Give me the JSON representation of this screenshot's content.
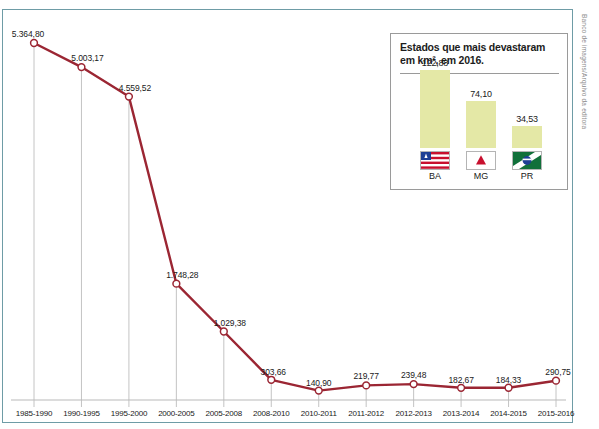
{
  "credit": "Banco de imagens/Arquivo da editora",
  "cropped_caption": "",
  "chart_data": {
    "type": "line",
    "title": "",
    "xlabel": "",
    "ylabel": "",
    "categories": [
      "1985-1990",
      "1990-1995",
      "1995-2000",
      "2000-2005",
      "2005-2008",
      "2008-2010",
      "2010-2011",
      "2011-2012",
      "2012-2013",
      "2013-2014",
      "2014-2015",
      "2015-2016"
    ],
    "values": [
      5364.8,
      5003.17,
      4559.52,
      1748.28,
      1029.38,
      303.66,
      140.9,
      219.77,
      239.48,
      182.67,
      184.33,
      290.75
    ],
    "value_labels": [
      "5.364,80",
      "5.003,17",
      "4.559,52",
      "1.748,28",
      "1.029,38",
      "303,66",
      "140,90",
      "219,77",
      "239,48",
      "182,67",
      "184,33",
      "290,75"
    ],
    "ylim": [
      0,
      5600
    ],
    "grid": false,
    "line_color": "#9b2633",
    "marker_fill": "#ffffff",
    "marker_stroke": "#9b2633"
  },
  "inset": {
    "title_line1": "Estados que mais devastaram",
    "title_line2": "em km², em 2016.",
    "chart_data": {
      "type": "bar",
      "title": "Estados que mais devastaram em km², em 2016.",
      "categories": [
        "BA",
        "MG",
        "PR"
      ],
      "values": [
        122.88,
        74.1,
        34.53
      ],
      "value_labels": [
        "122,88",
        "74,10",
        "34,53"
      ],
      "ylim": [
        0,
        140
      ],
      "bar_color": "#e4e8a6",
      "xlabel": "",
      "ylabel": "km²"
    },
    "flags": [
      {
        "state": "BA",
        "icon": "flag-bahia-icon"
      },
      {
        "state": "MG",
        "icon": "flag-minas-gerais-icon"
      },
      {
        "state": "PR",
        "icon": "flag-parana-icon"
      }
    ]
  }
}
